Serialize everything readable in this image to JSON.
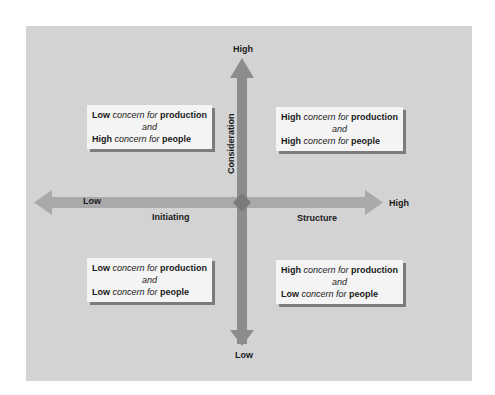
{
  "diagram": {
    "vertical_axis": {
      "label": "Consideration",
      "top": "High",
      "bottom": "Low"
    },
    "horizontal_axis": {
      "label_left": "Initiating",
      "label_right": "Structure",
      "left": "Low",
      "right": "High"
    },
    "quadrants": {
      "top_left": {
        "l1_level": "Low",
        "l1_mid": "concern for",
        "l1_obj": "production",
        "and": "and",
        "l2_level": "High",
        "l2_mid": "concern for",
        "l2_obj": "people"
      },
      "top_right": {
        "l1_level": "High",
        "l1_mid": "concern for",
        "l1_obj": "production",
        "and": "and",
        "l2_level": "High",
        "l2_mid": "concern for",
        "l2_obj": "people"
      },
      "bottom_left": {
        "l1_level": "Low",
        "l1_mid": "concern for",
        "l1_obj": "production",
        "and": "and",
        "l2_level": "Low",
        "l2_mid": "concern for",
        "l2_obj": "people"
      },
      "bottom_right": {
        "l1_level": "High",
        "l1_mid": "concern for",
        "l1_obj": "production",
        "and": "and",
        "l2_level": "Low",
        "l2_mid": "concern for",
        "l2_obj": "people"
      }
    },
    "colors": {
      "panel": "#d3d3d3",
      "v_arrow": "#8c8c8c",
      "h_arrow": "#a9a9a9",
      "center": "#7a7a7a",
      "box": "#f4f4f4",
      "shadow": "#7c7c7c"
    }
  }
}
